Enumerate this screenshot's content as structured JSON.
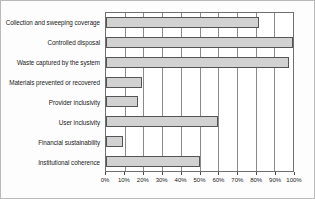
{
  "chart_data": {
    "type": "bar",
    "orientation": "horizontal",
    "title": "",
    "xlabel": "",
    "ylabel": "",
    "xlim": [
      0,
      100
    ],
    "grid": true,
    "legend": "none",
    "tick_labels": [
      "0%",
      "10%",
      "20%",
      "30%",
      "40%",
      "50%",
      "60%",
      "70%",
      "80%",
      "90%",
      "100%"
    ],
    "tick_values": [
      0,
      10,
      20,
      30,
      40,
      50,
      60,
      70,
      80,
      90,
      100
    ],
    "categories": [
      "Collection and sweeping coverage",
      "Controlled disposal",
      "Waste captured by the system",
      "Materials prevented or recovered",
      "Provider inclusivity",
      "User inclusivity",
      "Financial sustainability",
      "Institutional coherence"
    ],
    "values": [
      82,
      100,
      98,
      19,
      17,
      60,
      9,
      50
    ],
    "bar_fill_color": "#d2d2d2",
    "bar_edge_color": "#555555",
    "grid_color": "#8a8a8a",
    "axes_color": "#6f6f6f",
    "background_color": "#ffffff"
  }
}
